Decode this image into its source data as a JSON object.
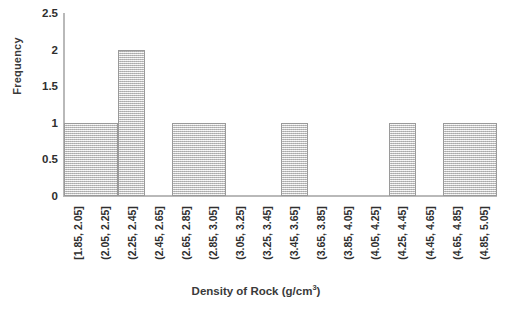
{
  "chart_data": {
    "type": "bar",
    "title": "",
    "xlabel": "Density of Rock (g/cm3)",
    "xlabel_base": "Density of Rock (g/cm",
    "xlabel_exponent": "3",
    "xlabel_suffix": ")",
    "ylabel": "Frequency",
    "ylim": [
      0,
      2.5
    ],
    "ytick_values": [
      0,
      0.5,
      1,
      1.5,
      2,
      2.5
    ],
    "ytick_labels": [
      "0",
      "0.5",
      "1",
      "1.5",
      "2",
      "2.5"
    ],
    "grid": false,
    "legend": "none",
    "categories": [
      "[1.85, 2.05]",
      "(2.05, 2.25]",
      "(2.25, 2.45]",
      "(2.45, 2.65]",
      "(2.65, 2.85]",
      "(2.85, 3.05]",
      "(3.05, 3.25]",
      "(3.25, 3.45]",
      "(3.45, 3.65]",
      "(3.65, 3.85]",
      "(3.85, 4.05]",
      "(4.05, 4.25]",
      "(4.25, 4.45]",
      "(4.45, 4.65]",
      "(4.65, 4.85]",
      "(4.85, 5.05]"
    ],
    "values": [
      1,
      1,
      2,
      0,
      1,
      1,
      0,
      0,
      1,
      0,
      0,
      0,
      1,
      0,
      1,
      1
    ],
    "bar_color": "#d4d4d4",
    "bar_edge_color": "#9a9a9a",
    "axis_color": "#b9b9b9",
    "text_color": "#2f2f2f"
  }
}
